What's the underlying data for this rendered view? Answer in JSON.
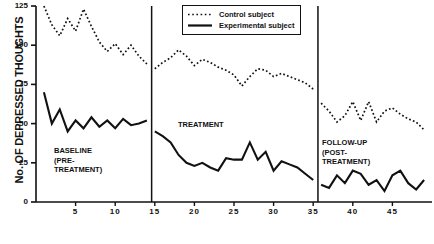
{
  "chart_data": {
    "type": "line",
    "title": "",
    "xlabel": "",
    "ylabel": "No. OF DEPRESSED THOUGHTS",
    "ylim": [
      0,
      125
    ],
    "xlim": [
      0,
      50
    ],
    "ytick_labels": [
      "0",
      "25",
      "50",
      "75",
      "100",
      "125"
    ],
    "yticks": [
      0,
      25,
      50,
      75,
      100,
      125
    ],
    "xtick_labels": [
      "5",
      "10",
      "15",
      "20",
      "25",
      "30",
      "35",
      "40",
      "45"
    ],
    "xticks": [
      5,
      10,
      15,
      20,
      25,
      30,
      35,
      40,
      45
    ],
    "grid": false,
    "legend_position": "top-center",
    "legend": [
      {
        "name": "Control subject",
        "style": "dotted"
      },
      {
        "name": "Experimental subject",
        "style": "solid"
      }
    ],
    "phase_dividers": [
      14.6,
      35.6
    ],
    "phases": [
      {
        "label": "BASELINE\n(PRE-\nTREATMENT)",
        "lines": [
          "BASELINE",
          "(PRE-",
          "TREATMENT)"
        ],
        "x_range": [
          1,
          14.6
        ]
      },
      {
        "label": "TREATMENT",
        "lines": [
          "TREATMENT"
        ],
        "x_range": [
          14.6,
          35.6
        ]
      },
      {
        "label": "FOLLOW-UP\n(POST-\nTREATMENT)",
        "lines": [
          "FOLLOW-UP",
          "(POST-",
          "TREATMENT)"
        ],
        "x_range": [
          35.6,
          50
        ]
      }
    ],
    "series": [
      {
        "name": "Control subject",
        "style": "dotted",
        "x": [
          1,
          2,
          3,
          4,
          5,
          6,
          7,
          8,
          9,
          10,
          11,
          12,
          13,
          14,
          15,
          16,
          17,
          18,
          19,
          20,
          21,
          22,
          23,
          24,
          25,
          26,
          27,
          28,
          29,
          30,
          31,
          32,
          33,
          34,
          35,
          36,
          37,
          38,
          39,
          40,
          41,
          42,
          43,
          44,
          45,
          46,
          47,
          48,
          49
        ],
        "values": [
          125,
          113,
          106,
          117,
          109,
          123,
          112,
          102,
          96,
          101,
          94,
          100,
          93,
          88,
          85,
          89,
          92,
          97,
          93,
          87,
          91,
          89,
          86,
          84,
          81,
          74,
          80,
          85,
          84,
          80,
          82,
          80,
          78,
          76,
          72,
          63,
          58,
          51,
          55,
          64,
          52,
          64,
          51,
          58,
          60,
          56,
          53,
          51,
          46
        ]
      },
      {
        "name": "Experimental subject",
        "style": "solid",
        "x": [
          1,
          2,
          3,
          4,
          5,
          6,
          7,
          8,
          9,
          10,
          11,
          12,
          13,
          14,
          15,
          16,
          17,
          18,
          19,
          20,
          21,
          22,
          23,
          24,
          25,
          26,
          27,
          28,
          29,
          30,
          31,
          32,
          33,
          34,
          35,
          36,
          37,
          38,
          39,
          40,
          41,
          42,
          43,
          44,
          45,
          46,
          47,
          48,
          49
        ],
        "values": [
          70,
          50,
          59,
          45,
          52,
          47,
          54,
          48,
          52,
          47,
          53,
          49,
          50,
          52,
          45,
          42,
          38,
          30,
          25,
          23,
          25,
          22,
          20,
          28,
          27,
          27,
          38,
          27,
          32,
          20,
          26,
          24,
          22,
          18,
          14,
          11,
          9,
          17,
          12,
          20,
          18,
          11,
          14,
          7,
          17,
          20,
          12,
          8,
          14
        ]
      }
    ]
  }
}
